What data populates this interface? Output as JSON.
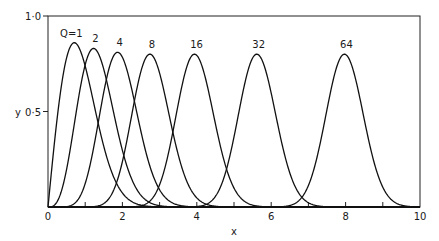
{
  "chart_data": {
    "type": "line",
    "title": "",
    "xlabel": "x",
    "ylabel": "y",
    "xlim": [
      0,
      10
    ],
    "ylim": [
      0,
      1.0
    ],
    "x_ticks": [
      0,
      1,
      2,
      3,
      4,
      5,
      6,
      7,
      8,
      9,
      10
    ],
    "x_tick_labels": [
      "0",
      "2",
      "4",
      "6",
      "8",
      "10"
    ],
    "y_tick_labels": [
      "0·5",
      "1·0"
    ],
    "grid": false,
    "legend_position": "inline labels above peaks",
    "series": [
      {
        "name": "Q=1",
        "label": "Q=1",
        "peak_x": 0.71,
        "peak_y": 0.86,
        "x": [
          0,
          0.25,
          0.5,
          0.71,
          1.0,
          1.5,
          2.0,
          2.5
        ],
        "values": [
          0,
          0.36,
          0.77,
          0.86,
          0.72,
          0.27,
          0.05,
          0.0
        ]
      },
      {
        "name": "Q=2",
        "label": "2",
        "peak_x": 1.22,
        "peak_y": 0.83,
        "x": [
          0,
          0.5,
          1.0,
          1.22,
          1.5,
          2.0,
          2.5,
          3.0
        ],
        "values": [
          0,
          0.25,
          0.76,
          0.83,
          0.72,
          0.31,
          0.06,
          0.0
        ]
      },
      {
        "name": "Q=4",
        "label": "4",
        "peak_x": 1.87,
        "peak_y": 0.81,
        "x": [
          0.5,
          1.0,
          1.5,
          1.87,
          2.5,
          3.0,
          3.5
        ],
        "values": [
          0.0,
          0.17,
          0.62,
          0.81,
          0.42,
          0.09,
          0.0
        ]
      },
      {
        "name": "Q=8",
        "label": "8",
        "peak_x": 2.74,
        "peak_y": 0.8,
        "x": [
          1.3,
          2.0,
          2.74,
          3.5,
          4.2
        ],
        "values": [
          0.0,
          0.22,
          0.8,
          0.23,
          0.0
        ]
      },
      {
        "name": "Q=16",
        "label": "16",
        "peak_x": 3.94,
        "peak_y": 0.8,
        "x": [
          2.4,
          3.2,
          3.94,
          4.7,
          5.5
        ],
        "values": [
          0.0,
          0.19,
          0.8,
          0.19,
          0.0
        ]
      },
      {
        "name": "Q=32",
        "label": "32",
        "peak_x": 5.61,
        "peak_y": 0.8,
        "x": [
          4.1,
          4.9,
          5.61,
          6.4,
          7.2
        ],
        "values": [
          0.0,
          0.2,
          0.8,
          0.2,
          0.0
        ]
      },
      {
        "name": "Q=64",
        "label": "64",
        "peak_x": 7.97,
        "peak_y": 0.8,
        "x": [
          6.4,
          7.2,
          7.97,
          8.8,
          9.6
        ],
        "values": [
          0.0,
          0.19,
          0.8,
          0.19,
          0.0
        ]
      }
    ]
  }
}
